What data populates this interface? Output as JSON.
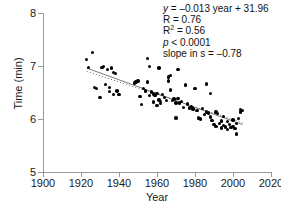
{
  "chart_data": {
    "type": "scatter",
    "title": "",
    "xlabel": "Year",
    "ylabel": "Time (min)",
    "xlim": [
      1900,
      2020
    ],
    "ylim": [
      5,
      8
    ],
    "xticks": [
      1900,
      1920,
      1940,
      1960,
      1980,
      2000,
      2020
    ],
    "xticklabels": [
      "1900",
      "1920",
      "1940",
      "1960",
      "1980",
      "2000",
      "2020"
    ],
    "yticks": [
      5,
      6,
      7,
      8
    ],
    "yticklabels": [
      "5",
      "6",
      "7",
      "8"
    ],
    "grid": false,
    "legend": null,
    "marker_color": "#000000",
    "axis_color": "#9a9a9a",
    "points": [
      [
        1923,
        7.12
      ],
      [
        1926,
        7.26
      ],
      [
        1924,
        6.97
      ],
      [
        1927,
        6.6
      ],
      [
        1928,
        6.58
      ],
      [
        1930,
        6.4
      ],
      [
        1931,
        6.97
      ],
      [
        1932,
        6.99
      ],
      [
        1933,
        6.65
      ],
      [
        1934,
        6.93
      ],
      [
        1935,
        6.6
      ],
      [
        1935,
        6.52
      ],
      [
        1936,
        6.96
      ],
      [
        1937,
        6.88
      ],
      [
        1937,
        6.46
      ],
      [
        1938,
        6.86
      ],
      [
        1939,
        6.53
      ],
      [
        1940,
        6.46
      ],
      [
        1948,
        6.68
      ],
      [
        1949,
        6.7
      ],
      [
        1950,
        6.72
      ],
      [
        1951,
        6.43
      ],
      [
        1952,
        6.27
      ],
      [
        1953,
        6.57
      ],
      [
        1954,
        6.53
      ],
      [
        1955,
        7.14
      ],
      [
        1955,
        6.7
      ],
      [
        1956,
        6.99
      ],
      [
        1956,
        6.44
      ],
      [
        1957,
        6.51
      ],
      [
        1958,
        6.47
      ],
      [
        1958,
        6.32
      ],
      [
        1959,
        6.44
      ],
      [
        1960,
        6.48
      ],
      [
        1960,
        6.25
      ],
      [
        1961,
        6.96
      ],
      [
        1961,
        6.36
      ],
      [
        1962,
        6.33
      ],
      [
        1962,
        6.29
      ],
      [
        1963,
        6.46
      ],
      [
        1964,
        6.41
      ],
      [
        1965,
        6.35
      ],
      [
        1966,
        6.79
      ],
      [
        1966,
        6.72
      ],
      [
        1967,
        6.82
      ],
      [
        1967,
        6.55
      ],
      [
        1968,
        6.35
      ],
      [
        1969,
        6.38
      ],
      [
        1970,
        6.3
      ],
      [
        1970,
        6.02
      ],
      [
        1971,
        6.93
      ],
      [
        1971,
        6.39
      ],
      [
        1972,
        6.3
      ],
      [
        1973,
        6.33
      ],
      [
        1974,
        6.22
      ],
      [
        1975,
        6.64
      ],
      [
        1976,
        6.28
      ],
      [
        1977,
        6.21
      ],
      [
        1978,
        6.24
      ],
      [
        1979,
        6.19
      ],
      [
        1980,
        6.58
      ],
      [
        1981,
        6.16
      ],
      [
        1982,
        6.02
      ],
      [
        1983,
        6.0
      ],
      [
        1984,
        6.2
      ],
      [
        1985,
        6.09
      ],
      [
        1986,
        6.66
      ],
      [
        1986,
        6.13
      ],
      [
        1987,
        6.11
      ],
      [
        1988,
        6.48
      ],
      [
        1988,
        6.04
      ],
      [
        1989,
        5.97
      ],
      [
        1990,
        5.9
      ],
      [
        1991,
        6.13
      ],
      [
        1991,
        5.86
      ],
      [
        1992,
        6.1
      ],
      [
        1993,
        5.92
      ],
      [
        1994,
        5.96
      ],
      [
        1994,
        5.83
      ],
      [
        1995,
        6.05
      ],
      [
        1995,
        5.88
      ],
      [
        1996,
        5.85
      ],
      [
        1997,
        5.95
      ],
      [
        1997,
        5.8
      ],
      [
        1998,
        5.9
      ],
      [
        1999,
        5.84
      ],
      [
        2000,
        5.98
      ],
      [
        2000,
        5.86
      ],
      [
        2001,
        5.82
      ],
      [
        2002,
        5.72
      ],
      [
        2002,
        5.92
      ],
      [
        2003,
        6.01
      ],
      [
        2004,
        6.13
      ],
      [
        2004,
        6.18
      ],
      [
        2005,
        6.16
      ]
    ],
    "fit_line": {
      "style": "solid",
      "color": "#6b6b6b",
      "x": [
        1923,
        2005
      ],
      "y": [
        6.961,
        5.895
      ]
    },
    "dotted_line": {
      "style": "dotted",
      "color": "#6b6b6b",
      "x": [
        1923,
        2005
      ],
      "y": [
        6.9,
        5.93
      ]
    }
  },
  "annotation": {
    "line1_prefix": "y",
    "line1_rest": " = –0.013 year + 31.96",
    "line2": "R = 0.76",
    "line3_prefix": "R",
    "line3_sup": "2",
    "line3_rest": " = 0.56",
    "line4_prefix": "p",
    "line4_rest": " < 0.0001",
    "line5": "slope in s = –0.78"
  }
}
